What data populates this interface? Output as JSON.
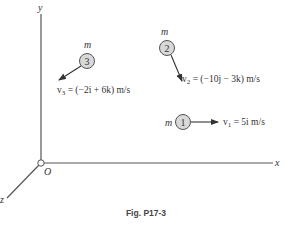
{
  "figure": {
    "caption": "Fig. P17-3",
    "axes": {
      "x_label": "x",
      "y_label": "y",
      "z_label": "z",
      "origin_label": "O"
    },
    "particles": [
      {
        "id": "1",
        "mass_label": "m",
        "velocity_label": "v",
        "velocity_sub": "1",
        "velocity_expr": " = 5i m/s"
      },
      {
        "id": "2",
        "mass_label": "m",
        "velocity_label": "v",
        "velocity_sub": "2",
        "velocity_expr": " = (−10j − 3k) m/s"
      },
      {
        "id": "3",
        "mass_label": "m",
        "velocity_label": "v",
        "velocity_sub": "3",
        "velocity_expr": " = (−2i + 6k) m/s"
      }
    ],
    "colors": {
      "line": "#555555",
      "particle_fill": "#d8d8d8",
      "particle_stroke": "#555555"
    }
  }
}
